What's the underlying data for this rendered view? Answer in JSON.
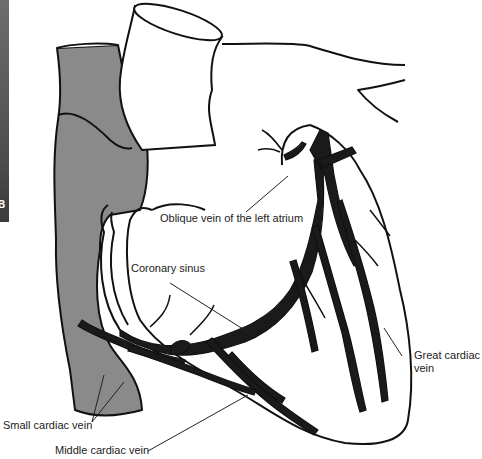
{
  "figure": {
    "panel_letter": "B",
    "colors": {
      "vessel_grey": "#8a8a8a",
      "outline": "#111111",
      "vein_fill": "#1a1a1a",
      "side_strip_top": "#6d6d6d",
      "side_strip_bottom": "#3a3a3a"
    }
  },
  "labels": {
    "oblique_vein": "Oblique vein of the left atrium",
    "coronary_sinus": "Coronary sinus",
    "great_cardiac_vein_line1": "Great cardiac",
    "great_cardiac_vein_line2": "vein",
    "small_cardiac_vein": "Small cardiac vein",
    "middle_cardiac_vein": "Middle cardiac vein"
  }
}
